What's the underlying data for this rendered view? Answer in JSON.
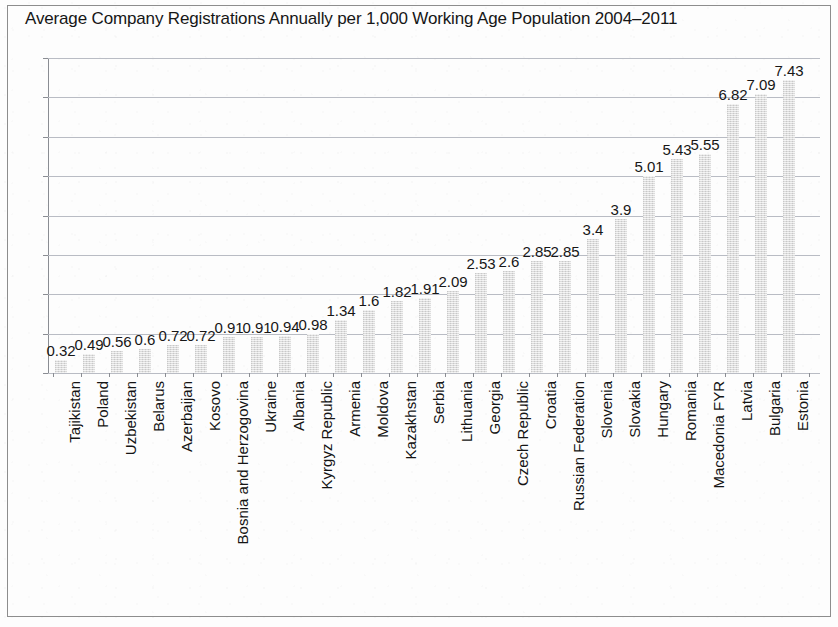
{
  "chart_data": {
    "type": "bar",
    "title": "Average Company Registrations Annually per 1,000 Working Age Population 2004–2011",
    "xlabel": "",
    "ylabel": "",
    "ylim": [
      0,
      8
    ],
    "yticks": [
      0,
      1,
      2,
      3,
      4,
      5,
      6,
      7,
      8
    ],
    "grid": true,
    "legend": "none",
    "bar_color": "#dcdcdc",
    "categories": [
      "Tajikistan",
      "Poland",
      "Uzbekistan",
      "Belarus",
      "Azerbaijan",
      "Kosovo",
      "Bosnia and Herzogovina",
      "Ukraine",
      "Albania",
      "Kyrgyz Republic",
      "Armenia",
      "Moldova",
      "Kazakhstan",
      "Serbia",
      "Lithuania",
      "Georgia",
      "Czech Republic",
      "Croatia",
      "Russian Federation",
      "Slovenia",
      "Slovakia",
      "Hungary",
      "Romania",
      "Macedonia FYR",
      "Latvia",
      "Bulgaria",
      "Estonia"
    ],
    "values": [
      0.32,
      0.49,
      0.56,
      0.6,
      0.72,
      0.72,
      0.91,
      0.91,
      0.94,
      0.98,
      1.34,
      1.6,
      1.82,
      1.91,
      2.09,
      2.53,
      2.6,
      2.85,
      2.85,
      3.4,
      3.9,
      5.01,
      5.43,
      5.55,
      6.82,
      7.09,
      7.43
    ],
    "value_labels": [
      "0.32",
      "0.49",
      "0.56",
      "0.6",
      "0.72",
      "0.72",
      "0.91",
      "0.91",
      "0.94",
      "0.98",
      "1.34",
      "1.6",
      "1.82",
      "1.91",
      "2.09",
      "2.53",
      "2.6",
      "2.85",
      "2.85",
      "3.4",
      "3.9",
      "5.01",
      "5.43",
      "5.55",
      "6.82",
      "7.09",
      "7.43"
    ]
  }
}
